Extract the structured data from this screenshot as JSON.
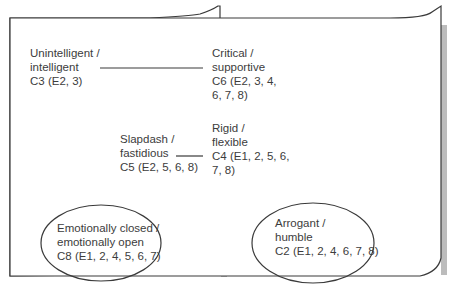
{
  "diagram": {
    "colors": {
      "stroke": "#3a3a3a",
      "shadow": "#b8b8b8",
      "background": "#ffffff",
      "text": "#3c3c3c"
    },
    "nodes": [
      {
        "id": "C3",
        "lines": [
          "Unintelligent /",
          "intelligent",
          "C3 (E2, 3)"
        ]
      },
      {
        "id": "C6",
        "lines": [
          "Critical /",
          "supportive",
          "C6 (E2, 3, 4,",
          "6, 7, 8)"
        ]
      },
      {
        "id": "C5",
        "lines": [
          "Slapdash /",
          "fastidious",
          "C5 (E2, 5, 6, 8)"
        ]
      },
      {
        "id": "C4",
        "lines": [
          "Rigid /",
          "flexible",
          "C4 (E1, 2, 5, 6,",
          "7, 8)"
        ]
      },
      {
        "id": "C8",
        "lines": [
          "Emotionally closed /",
          "emotionally open",
          "C8 (E1, 2, 4, 5, 6, 7)"
        ],
        "circled": true
      },
      {
        "id": "C2",
        "lines": [
          "Arrogant /",
          "humble",
          "C2 (E1, 2, 4, 6, 7, 8)"
        ],
        "circled": true
      }
    ],
    "links": [
      {
        "from": "C3",
        "to": "C6"
      },
      {
        "from": "C5",
        "to": "C4"
      }
    ]
  }
}
